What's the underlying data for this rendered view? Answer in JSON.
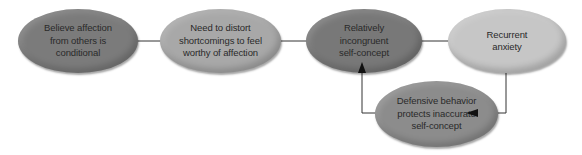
{
  "diagram": {
    "type": "cycle-flowchart",
    "nodes": [
      {
        "id": "n1",
        "label": "Believe affection\nfrom others is\nconditional",
        "color": "#7b7b7b"
      },
      {
        "id": "n2",
        "label": "Need to distort\nshortcomings to feel\nworthy of affection",
        "color": "#a8a8a8"
      },
      {
        "id": "n3",
        "label": "Relatively\nincongruent\nself-concept",
        "color": "#787878"
      },
      {
        "id": "n4",
        "label": "Recurrent\nanxiety",
        "color": "#c6c6c6"
      },
      {
        "id": "n5",
        "label": "Defensive behavior\nprotects inaccurate\nself-concept",
        "color": "#8c8c8c"
      }
    ],
    "edges": [
      {
        "from": "n1",
        "to": "n2"
      },
      {
        "from": "n2",
        "to": "n3"
      },
      {
        "from": "n3",
        "to": "n4"
      },
      {
        "from": "n4",
        "to": "n5"
      },
      {
        "from": "n5",
        "to": "n3"
      }
    ],
    "connector_color": "#333333",
    "arrow_color": "#111111"
  }
}
